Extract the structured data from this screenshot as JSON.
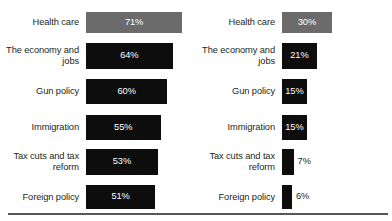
{
  "chart_data": {
    "type": "bar",
    "title": "",
    "xlabel": "",
    "ylabel": "",
    "grid": false,
    "legend": "none",
    "orientation": "horizontal",
    "categories": [
      "Health care",
      "The economy and\njobs",
      "Gun policy",
      "Immigration",
      "Tax cuts and tax\nreform",
      "Foreign policy"
    ],
    "panels": [
      {
        "name": "left",
        "xlim": [
          0,
          100
        ],
        "bars": [
          {
            "category": "Health care",
            "value": 71,
            "label": "71%",
            "color": "#6b6b6b",
            "label_position": "inside"
          },
          {
            "category": "The economy and\njobs",
            "value": 64,
            "label": "64%",
            "color": "#0d0d0d",
            "label_position": "inside"
          },
          {
            "category": "Gun policy",
            "value": 60,
            "label": "60%",
            "color": "#0d0d0d",
            "label_position": "inside"
          },
          {
            "category": "Immigration",
            "value": 55,
            "label": "55%",
            "color": "#0d0d0d",
            "label_position": "inside"
          },
          {
            "category": "Tax cuts and tax\nreform",
            "value": 53,
            "label": "53%",
            "color": "#0d0d0d",
            "label_position": "inside"
          },
          {
            "category": "Foreign policy",
            "value": 51,
            "label": "51%",
            "color": "#0d0d0d",
            "label_position": "inside"
          }
        ]
      },
      {
        "name": "right",
        "xlim": [
          0,
          100
        ],
        "bars": [
          {
            "category": "Health care",
            "value": 30,
            "label": "30%",
            "color": "#6b6b6b",
            "label_position": "inside"
          },
          {
            "category": "The economy and\njobs",
            "value": 21,
            "label": "21%",
            "color": "#0d0d0d",
            "label_position": "inside"
          },
          {
            "category": "Gun policy",
            "value": 15,
            "label": "15%",
            "color": "#0d0d0d",
            "label_position": "inside"
          },
          {
            "category": "Immigration",
            "value": 15,
            "label": "15%",
            "color": "#0d0d0d",
            "label_position": "inside"
          },
          {
            "category": "Tax cuts and tax\nreform",
            "value": 7,
            "label": "7%",
            "color": "#0d0d0d",
            "label_position": "outside"
          },
          {
            "category": "Foreign policy",
            "value": 6,
            "label": "6%",
            "color": "#0d0d0d",
            "label_position": "outside"
          }
        ]
      }
    ]
  },
  "colors": {
    "bar_primary": "#0d0d0d",
    "bar_highlight": "#6b6b6b",
    "text": "#231f20",
    "value_text_inside": "#ffffff",
    "rule": "#58585a",
    "background": "#ffffff"
  }
}
